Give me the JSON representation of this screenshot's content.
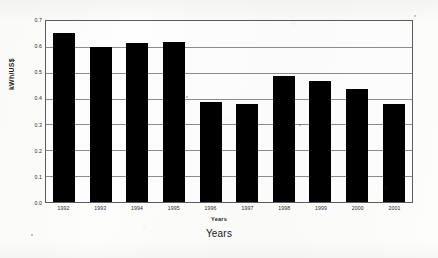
{
  "chart_data": {
    "type": "bar",
    "title": "",
    "subtitle": "",
    "xlabel": "Years",
    "ylabel": "kWh/US$",
    "categories": [
      "1992",
      "1993",
      "1994",
      "1995",
      "1996",
      "1997",
      "1998",
      "1999",
      "2000",
      "2001"
    ],
    "values": [
      0.655,
      0.6,
      0.615,
      0.617,
      0.388,
      0.378,
      0.487,
      0.468,
      0.438,
      0.378
    ],
    "series": [
      {
        "name": "Energy intensity",
        "values": [
          0.655,
          0.6,
          0.615,
          0.617,
          0.388,
          0.378,
          0.487,
          0.468,
          0.438,
          0.378
        ]
      }
    ],
    "ylim": [
      0.0,
      0.7
    ],
    "ytick_labels": [
      "0.7",
      "0.6",
      "0.5",
      "0.4",
      "0.3",
      "0.2",
      "0.1",
      "0.0"
    ],
    "ytick_values": [
      0.7,
      0.6,
      0.5,
      0.4,
      0.3,
      0.2,
      0.1,
      0.0
    ],
    "grid": true,
    "grid_axis": "y",
    "legend": false,
    "legend_position": "none",
    "bar_color": "#000000",
    "plot_background": "#fefefe",
    "axis_color": "#5d5d5d",
    "gridline_color": "#8d8d8d"
  },
  "axes": {
    "y_title": "kWh/US$",
    "x_title_inner": "Years",
    "x_title_outer": "Years"
  }
}
